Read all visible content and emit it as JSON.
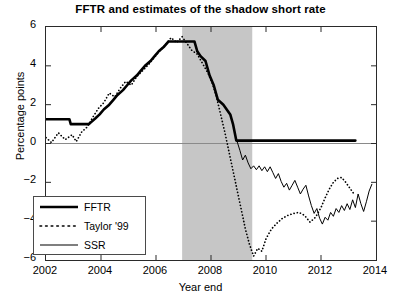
{
  "chart_data": {
    "type": "line",
    "title": "FFTR and estimates of the shadow short rate",
    "xlabel": "Year end",
    "ylabel": "Percentage points",
    "xlim": [
      2002,
      2014
    ],
    "ylim": [
      -6,
      6
    ],
    "xticks": [
      2002,
      2004,
      2006,
      2008,
      2010,
      2012,
      2014
    ],
    "yticks": [
      6,
      4,
      2,
      0,
      -2,
      -4,
      -6
    ],
    "xtick_labels": [
      "2002",
      "2004",
      "2006",
      "2008",
      "2010",
      "2012",
      "2014"
    ],
    "ytick_labels": [
      "6",
      "4",
      "2",
      "0",
      "-2",
      "-4",
      "-6"
    ],
    "grid": false,
    "legend_position": "lower left",
    "zero_line": 0,
    "shaded_regions": [
      {
        "name": "recession-band",
        "x_start": 2006.95,
        "x_end": 2009.5,
        "color": "#c6c6c6"
      }
    ],
    "series": [
      {
        "name": "FFTR",
        "style": "solid",
        "width": 2.6,
        "color": "#000000",
        "points": [
          [
            2002.0,
            1.25
          ],
          [
            2002.85,
            1.25
          ],
          [
            2002.9,
            1.0
          ],
          [
            2003.55,
            1.0
          ],
          [
            2003.6,
            1.05
          ],
          [
            2003.8,
            1.3
          ],
          [
            2003.95,
            1.5
          ],
          [
            2004.1,
            1.75
          ],
          [
            2004.3,
            2.0
          ],
          [
            2004.45,
            2.25
          ],
          [
            2004.6,
            2.5
          ],
          [
            2004.8,
            2.75
          ],
          [
            2004.95,
            3.0
          ],
          [
            2005.1,
            3.25
          ],
          [
            2005.3,
            3.5
          ],
          [
            2005.45,
            3.75
          ],
          [
            2005.6,
            4.0
          ],
          [
            2005.8,
            4.25
          ],
          [
            2005.95,
            4.5
          ],
          [
            2006.1,
            4.75
          ],
          [
            2006.3,
            5.0
          ],
          [
            2006.45,
            5.25
          ],
          [
            2007.4,
            5.25
          ],
          [
            2007.5,
            4.75
          ],
          [
            2007.62,
            4.5
          ],
          [
            2007.8,
            4.25
          ],
          [
            2007.95,
            3.5
          ],
          [
            2008.1,
            3.0
          ],
          [
            2008.25,
            2.25
          ],
          [
            2008.45,
            2.0
          ],
          [
            2008.7,
            1.5
          ],
          [
            2008.8,
            1.0
          ],
          [
            2008.92,
            0.15
          ],
          [
            2013.25,
            0.15
          ]
        ]
      },
      {
        "name": "Taylor '99",
        "style": "dotted",
        "width": 1.4,
        "color": "#000000",
        "points": [
          [
            2002.0,
            0.3
          ],
          [
            2002.2,
            0.05
          ],
          [
            2002.45,
            0.55
          ],
          [
            2002.7,
            0.2
          ],
          [
            2002.95,
            0.45
          ],
          [
            2003.1,
            0.1
          ],
          [
            2003.3,
            0.6
          ],
          [
            2003.5,
            0.85
          ],
          [
            2003.7,
            1.35
          ],
          [
            2003.9,
            1.8
          ],
          [
            2004.1,
            2.1
          ],
          [
            2004.3,
            2.6
          ],
          [
            2004.5,
            2.4
          ],
          [
            2004.7,
            2.85
          ],
          [
            2004.9,
            3.2
          ],
          [
            2005.1,
            3.0
          ],
          [
            2005.3,
            3.45
          ],
          [
            2005.55,
            3.8
          ],
          [
            2005.75,
            4.1
          ],
          [
            2005.95,
            4.45
          ],
          [
            2006.15,
            4.8
          ],
          [
            2006.35,
            5.1
          ],
          [
            2006.55,
            5.45
          ],
          [
            2006.75,
            5.2
          ],
          [
            2006.95,
            5.5
          ],
          [
            2007.1,
            5.2
          ],
          [
            2007.3,
            4.8
          ],
          [
            2007.5,
            4.6
          ],
          [
            2007.7,
            4.1
          ],
          [
            2007.9,
            3.6
          ],
          [
            2008.05,
            3.1
          ],
          [
            2008.2,
            2.4
          ],
          [
            2008.35,
            1.5
          ],
          [
            2008.5,
            0.6
          ],
          [
            2008.65,
            -0.4
          ],
          [
            2008.8,
            -1.4
          ],
          [
            2008.95,
            -2.4
          ],
          [
            2009.1,
            -3.4
          ],
          [
            2009.25,
            -4.4
          ],
          [
            2009.4,
            -5.2
          ],
          [
            2009.55,
            -5.8
          ],
          [
            2009.7,
            -5.4
          ],
          [
            2009.85,
            -5.55
          ],
          [
            2010.0,
            -4.9
          ],
          [
            2010.2,
            -4.4
          ],
          [
            2010.4,
            -4.1
          ],
          [
            2010.6,
            -3.85
          ],
          [
            2010.8,
            -3.7
          ],
          [
            2011.0,
            -3.6
          ],
          [
            2011.2,
            -3.55
          ],
          [
            2011.4,
            -3.7
          ],
          [
            2011.6,
            -4.05
          ],
          [
            2011.8,
            -3.8
          ],
          [
            2012.0,
            -3.3
          ],
          [
            2012.15,
            -2.8
          ],
          [
            2012.3,
            -2.35
          ],
          [
            2012.45,
            -2.0
          ],
          [
            2012.6,
            -1.8
          ],
          [
            2012.75,
            -1.75
          ],
          [
            2012.9,
            -2.0
          ],
          [
            2013.05,
            -2.3
          ],
          [
            2013.2,
            -2.6
          ]
        ]
      },
      {
        "name": "SSR",
        "style": "solid",
        "width": 1.0,
        "color": "#000000",
        "points": [
          [
            2008.95,
            0.1
          ],
          [
            2009.05,
            -0.35
          ],
          [
            2009.15,
            -0.85
          ],
          [
            2009.25,
            -0.6
          ],
          [
            2009.35,
            -1.0
          ],
          [
            2009.45,
            -1.3
          ],
          [
            2009.55,
            -1.15
          ],
          [
            2009.65,
            -1.35
          ],
          [
            2009.75,
            -1.15
          ],
          [
            2009.85,
            -1.4
          ],
          [
            2009.95,
            -1.2
          ],
          [
            2010.05,
            -1.45
          ],
          [
            2010.15,
            -1.2
          ],
          [
            2010.25,
            -1.5
          ],
          [
            2010.35,
            -1.8
          ],
          [
            2010.45,
            -1.55
          ],
          [
            2010.55,
            -1.95
          ],
          [
            2010.65,
            -2.25
          ],
          [
            2010.75,
            -2.05
          ],
          [
            2010.85,
            -2.4
          ],
          [
            2010.95,
            -2.15
          ],
          [
            2011.05,
            -1.9
          ],
          [
            2011.15,
            -2.25
          ],
          [
            2011.25,
            -2.6
          ],
          [
            2011.35,
            -2.35
          ],
          [
            2011.45,
            -2.15
          ],
          [
            2011.55,
            -2.7
          ],
          [
            2011.65,
            -3.2
          ],
          [
            2011.75,
            -3.6
          ],
          [
            2011.85,
            -3.35
          ],
          [
            2011.95,
            -3.85
          ],
          [
            2012.05,
            -4.15
          ],
          [
            2012.15,
            -3.8
          ],
          [
            2012.25,
            -3.95
          ],
          [
            2012.35,
            -3.55
          ],
          [
            2012.45,
            -3.75
          ],
          [
            2012.55,
            -3.35
          ],
          [
            2012.65,
            -3.55
          ],
          [
            2012.75,
            -3.2
          ],
          [
            2012.85,
            -3.45
          ],
          [
            2012.95,
            -3.1
          ],
          [
            2013.05,
            -3.4
          ],
          [
            2013.15,
            -2.9
          ],
          [
            2013.25,
            -3.3
          ],
          [
            2013.35,
            -2.6
          ],
          [
            2013.45,
            -3.1
          ],
          [
            2013.55,
            -3.5
          ],
          [
            2013.65,
            -3.0
          ],
          [
            2013.75,
            -2.45
          ],
          [
            2013.85,
            -2.1
          ]
        ]
      }
    ]
  },
  "legend": {
    "items": [
      {
        "label": "FFTR",
        "style": "solid-thick"
      },
      {
        "label": "Taylor '99",
        "style": "dotted"
      },
      {
        "label": "SSR",
        "style": "solid-thin"
      }
    ]
  }
}
